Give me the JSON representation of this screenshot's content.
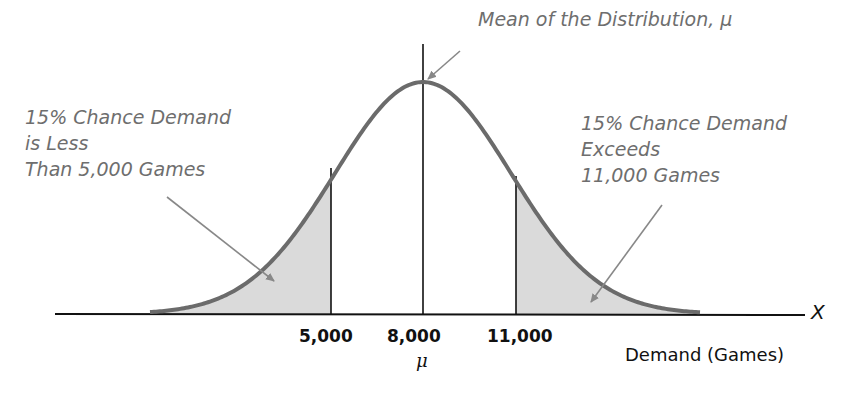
{
  "annotations": {
    "mean": "Mean of the Distribution, μ",
    "left_tail": [
      "15% Chance Demand",
      "is Less",
      "Than 5,000 Games"
    ],
    "right_tail": [
      "15% Chance Demand",
      "Exceeds",
      "11,000 Games"
    ]
  },
  "axis": {
    "ticks": [
      "5,000",
      "8,000",
      "11,000"
    ],
    "mu_label": "μ",
    "xlabel": "Demand (Games)",
    "variable": "X"
  },
  "colors": {
    "curve": "#6b6b6b",
    "shade": "#d9d9d9",
    "text_annotation": "#6e6e6e",
    "axis": "#111111"
  },
  "chart_data": {
    "type": "area",
    "title": "",
    "distribution": "normal",
    "mean": 8000,
    "xlabel": "Demand (Games)",
    "ylabel": "",
    "x_variable": "X",
    "tick_labels": [
      "5,000",
      "8,000",
      "11,000"
    ],
    "tick_values": [
      5000,
      8000,
      11000
    ],
    "shaded_regions": [
      {
        "name": "left tail",
        "range": [
          null,
          5000
        ],
        "probability": 0.15,
        "label": "15% Chance Demand is Less Than 5,000 Games"
      },
      {
        "name": "right tail",
        "range": [
          11000,
          null
        ],
        "probability": 0.15,
        "label": "15% Chance Demand Exceeds 11,000 Games"
      }
    ],
    "annotations": [
      "Mean of the Distribution, μ"
    ],
    "grid": false,
    "legend": "none"
  }
}
